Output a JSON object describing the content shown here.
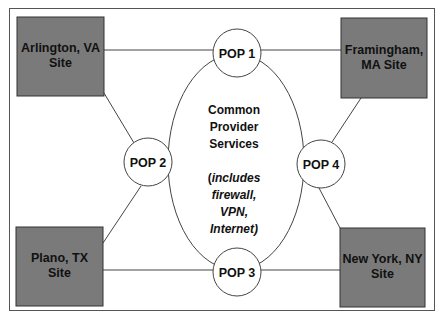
{
  "diagram": {
    "colors": {
      "background": "#ffffff",
      "site_fill": "#7a7a7a",
      "site_stroke": "#333333",
      "line": "#444444",
      "node_fill": "#ffffff",
      "text": "#111111"
    },
    "sites": [
      {
        "id": "arlington",
        "line1": "Arlington, VA",
        "line2": "Site"
      },
      {
        "id": "framingham",
        "line1": "Framingham,",
        "line2": "MA Site"
      },
      {
        "id": "plano",
        "line1": "Plano, TX",
        "line2": "Site"
      },
      {
        "id": "newyork",
        "line1": "New York, NY",
        "line2": "Site"
      }
    ],
    "pops": [
      {
        "id": "pop1",
        "label": "POP 1"
      },
      {
        "id": "pop2",
        "label": "POP 2"
      },
      {
        "id": "pop3",
        "label": "POP 3"
      },
      {
        "id": "pop4",
        "label": "POP 4"
      }
    ],
    "center": {
      "title_lines": [
        "Common",
        "Provider",
        "Services"
      ],
      "note_open": "(",
      "note_lines": [
        "includes",
        "firewall,",
        "VPN,",
        "Internet)"
      ]
    },
    "connections": [
      [
        "arlington",
        "pop1"
      ],
      [
        "arlington",
        "pop2"
      ],
      [
        "framingham",
        "pop1"
      ],
      [
        "framingham",
        "pop4"
      ],
      [
        "plano",
        "pop2"
      ],
      [
        "plano",
        "pop3"
      ],
      [
        "newyork",
        "pop3"
      ],
      [
        "newyork",
        "pop4"
      ]
    ]
  }
}
